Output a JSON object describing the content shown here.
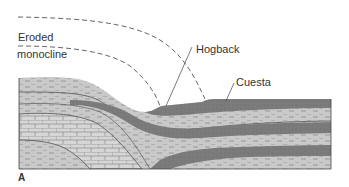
{
  "figure": {
    "panel_label": "A",
    "labels": {
      "eroded_line1": "Eroded",
      "eroded_line2": "monocline",
      "hogback": "Hogback",
      "cuesta": "Cuesta"
    },
    "colors": {
      "dark_layer": "#7a7a7a",
      "light_layer": "#c9c9c9",
      "limestone": "#d4d4d4",
      "outline": "#444444",
      "dash": "#555555",
      "text": "#333333"
    }
  }
}
